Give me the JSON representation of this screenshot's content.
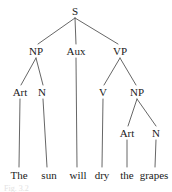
{
  "figure": {
    "kind": "syntax-tree-diagram",
    "sentence": "The sun will dry the grapes",
    "caption": "Fig. 3.2",
    "colors": {
      "background": "#ffffff",
      "ink": "#1a1a1a",
      "edge": "#555555"
    }
  },
  "nodes": {
    "s": {
      "label": "S",
      "x": 75,
      "y": 11
    },
    "np1": {
      "label": "NP",
      "x": 36,
      "y": 51
    },
    "aux": {
      "label": "Aux",
      "x": 76,
      "y": 51
    },
    "vp": {
      "label": "VP",
      "x": 120,
      "y": 51
    },
    "art1": {
      "label": "Art",
      "x": 20,
      "y": 92
    },
    "n1": {
      "label": "N",
      "x": 42,
      "y": 92
    },
    "v": {
      "label": "V",
      "x": 103,
      "y": 92
    },
    "np2": {
      "label": "NP",
      "x": 137,
      "y": 92
    },
    "art2": {
      "label": "Art",
      "x": 127,
      "y": 133
    },
    "n2": {
      "label": "N",
      "x": 156,
      "y": 133
    }
  },
  "leaves": {
    "the1": {
      "label": "The",
      "x": 19,
      "y": 175
    },
    "sun": {
      "label": "sun",
      "x": 49,
      "y": 175
    },
    "will": {
      "label": "will",
      "x": 78,
      "y": 175
    },
    "dry": {
      "label": "dry",
      "x": 102,
      "y": 175
    },
    "the2": {
      "label": "the",
      "x": 127,
      "y": 175
    },
    "grapes": {
      "label": "grapes",
      "x": 154,
      "y": 175
    }
  },
  "edges": [
    {
      "name": "s-to-np",
      "x1": 75,
      "y1": 18,
      "x2": 38,
      "y2": 44
    },
    {
      "name": "s-to-aux",
      "x1": 75,
      "y1": 18,
      "x2": 76,
      "y2": 44
    },
    {
      "name": "s-to-vp",
      "x1": 75,
      "y1": 18,
      "x2": 118,
      "y2": 44
    },
    {
      "name": "np1-to-art1",
      "x1": 36,
      "y1": 58,
      "x2": 21,
      "y2": 85
    },
    {
      "name": "np1-to-n1",
      "x1": 36,
      "y1": 58,
      "x2": 43,
      "y2": 85
    },
    {
      "name": "aux-to-will",
      "x1": 76,
      "y1": 58,
      "x2": 77,
      "y2": 167
    },
    {
      "name": "vp-to-v",
      "x1": 120,
      "y1": 58,
      "x2": 104,
      "y2": 85
    },
    {
      "name": "vp-to-np2",
      "x1": 120,
      "y1": 58,
      "x2": 136,
      "y2": 85
    },
    {
      "name": "art1-to-the1",
      "x1": 20,
      "y1": 99,
      "x2": 19,
      "y2": 167
    },
    {
      "name": "n1-to-sun",
      "x1": 43,
      "y1": 99,
      "x2": 47,
      "y2": 167
    },
    {
      "name": "v-to-dry",
      "x1": 103,
      "y1": 99,
      "x2": 102,
      "y2": 167
    },
    {
      "name": "np2-to-art2",
      "x1": 137,
      "y1": 99,
      "x2": 128,
      "y2": 126
    },
    {
      "name": "np2-to-n2",
      "x1": 137,
      "y1": 99,
      "x2": 156,
      "y2": 126
    },
    {
      "name": "art2-to-the2",
      "x1": 127,
      "y1": 140,
      "x2": 127,
      "y2": 167
    },
    {
      "name": "n2-to-grapes",
      "x1": 156,
      "y1": 140,
      "x2": 155,
      "y2": 167
    }
  ]
}
